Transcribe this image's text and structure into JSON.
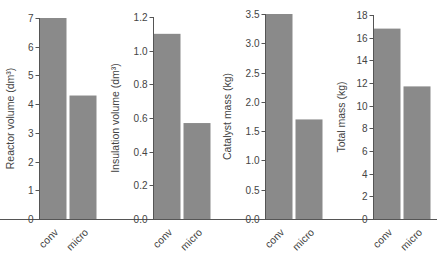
{
  "chart_data": [
    {
      "type": "bar",
      "title": "",
      "xlabel": "",
      "ylabel": "Reactor volume (dm³)",
      "categories": [
        "conv",
        "micro"
      ],
      "values": [
        7.0,
        4.3
      ],
      "ylim": [
        0,
        7
      ],
      "yticks": [
        0,
        1,
        2,
        3,
        4,
        5,
        6,
        7
      ],
      "ytick_labels": [
        "0",
        "1",
        "2",
        "3",
        "4",
        "5",
        "6",
        "7"
      ],
      "grid": false
    },
    {
      "type": "bar",
      "title": "",
      "xlabel": "",
      "ylabel": "Insulation volume (dm³)",
      "categories": [
        "conv",
        "micro"
      ],
      "values": [
        1.1,
        0.57
      ],
      "ylim": [
        0,
        1.2
      ],
      "yticks": [
        0,
        0.2,
        0.4,
        0.6,
        0.8,
        1.0,
        1.2
      ],
      "ytick_labels": [
        "0.0",
        "0.2",
        "0.4",
        "0.6",
        "0.8",
        "1.0",
        "1.2"
      ],
      "grid": false
    },
    {
      "type": "bar",
      "title": "",
      "xlabel": "",
      "ylabel": "Catalyst mass (kg)",
      "categories": [
        "conv",
        "micro"
      ],
      "values": [
        3.5,
        1.7
      ],
      "ylim": [
        0,
        3.5
      ],
      "yticks": [
        0,
        0.5,
        1.0,
        1.5,
        2.0,
        2.5,
        3.0,
        3.5
      ],
      "ytick_labels": [
        "0.0",
        "0.5",
        "1.0",
        "1.5",
        "2.0",
        "2.5",
        "3.0",
        "3.5"
      ],
      "grid": false
    },
    {
      "type": "bar",
      "title": "",
      "xlabel": "",
      "ylabel": "Total mass (kg)",
      "categories": [
        "conv",
        "micro"
      ],
      "values": [
        16.8,
        11.7
      ],
      "ylim": [
        0,
        18
      ],
      "yticks": [
        0,
        2,
        4,
        6,
        8,
        10,
        12,
        14,
        16,
        18
      ],
      "ytick_labels": [
        "0",
        "2",
        "4",
        "6",
        "8",
        "10",
        "12",
        "14",
        "16",
        "18"
      ],
      "grid": false
    }
  ],
  "colors": {
    "bar": "#8a8a8a",
    "axis": "#555555",
    "text": "#444444"
  }
}
